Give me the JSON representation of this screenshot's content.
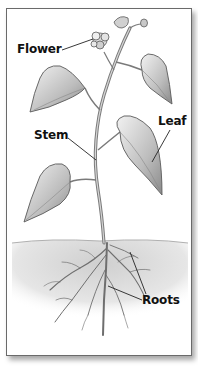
{
  "diagram": {
    "labels": [
      {
        "id": "flower",
        "text": "Flower"
      },
      {
        "id": "leaf",
        "text": "Leaf"
      },
      {
        "id": "stem",
        "text": "Stem"
      },
      {
        "id": "roots",
        "text": "Roots"
      }
    ]
  },
  "colors": {
    "frame_border": "#6a6a6a",
    "label_text": "#111111",
    "leader_line": "#222222",
    "ink": "#5a5a5a",
    "soil": "#d8d8d8"
  }
}
